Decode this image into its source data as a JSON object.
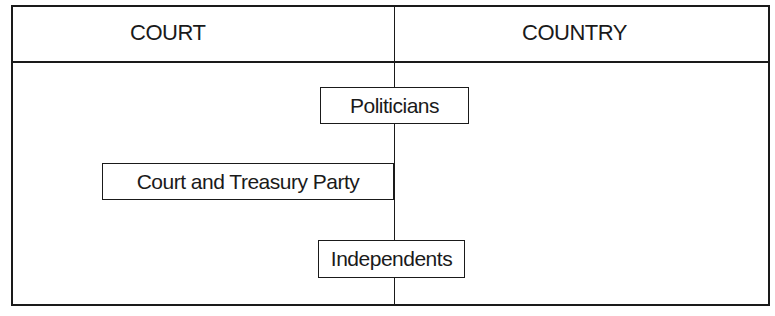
{
  "diagram": {
    "columns": [
      {
        "id": "court",
        "label": "COURT"
      },
      {
        "id": "country",
        "label": "COUNTRY"
      }
    ],
    "groups": [
      {
        "id": "politicians",
        "label": "Politicians",
        "position": "spans divider, mostly Country side",
        "order": 1
      },
      {
        "id": "court-treasury",
        "label": "Court and Treasury Party",
        "position": "Court side, ends at divider",
        "order": 2
      },
      {
        "id": "independents",
        "label": "Independents",
        "position": "spans divider, mostly Country side",
        "order": 3
      }
    ],
    "colors": {
      "line": "#1a1a1a",
      "background": "#ffffff",
      "text": "#1a1a1a"
    }
  }
}
